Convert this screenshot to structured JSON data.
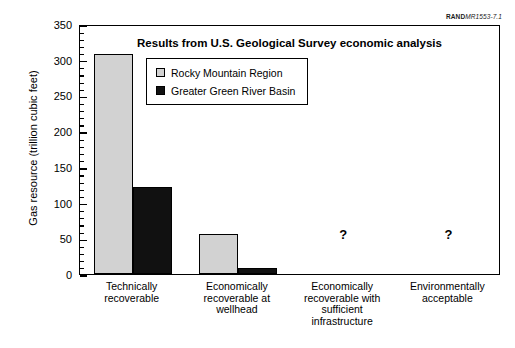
{
  "source_tag": {
    "brand": "RAND",
    "document": "MR1553-7.1"
  },
  "chart_data": {
    "type": "bar",
    "title": "Results from U.S. Geological Survey economic analysis",
    "xlabel": "",
    "ylabel": "Gas resource (trillion cubic feet)",
    "ylim": [
      0,
      350
    ],
    "yticks": [
      0,
      50,
      100,
      150,
      200,
      250,
      300,
      350
    ],
    "ytick_labels": [
      "0",
      "50",
      "100",
      "150",
      "200",
      "250",
      "300",
      "350"
    ],
    "minor_tick_step": 10,
    "grid": false,
    "legend_position": "upper-left-inside",
    "categories": [
      "Technically recoverable",
      "Economically recoverable at wellhead",
      "Economically recoverable with sufficient infrastructure",
      "Environmentally acceptable"
    ],
    "category_lines": [
      [
        "Technically",
        "recoverable"
      ],
      [
        "Economically",
        "recoverable at",
        "wellhead"
      ],
      [
        "Economically",
        "recoverable with",
        "sufficient",
        "infrastructure"
      ],
      [
        "Environmentally",
        "acceptable"
      ]
    ],
    "series": [
      {
        "name": "Rocky Mountain Region",
        "color": "#d2d2d2",
        "values": [
          308,
          56,
          null,
          null
        ],
        "value_labels": [
          "308",
          "56",
          "?",
          "?"
        ]
      },
      {
        "name": "Greater Green River Basin",
        "color": "#111111",
        "values": [
          122,
          8,
          null,
          null
        ],
        "value_labels": [
          "122",
          "8",
          "?",
          "?"
        ]
      }
    ],
    "unknown_marker": "?",
    "unknown_categories": [
      "Economically recoverable with sufficient infrastructure",
      "Environmentally acceptable"
    ]
  },
  "colors": {
    "series_rocky_mountain": "#d2d2d2",
    "series_green_river": "#111111",
    "axis": "#000000",
    "background": "#ffffff"
  }
}
